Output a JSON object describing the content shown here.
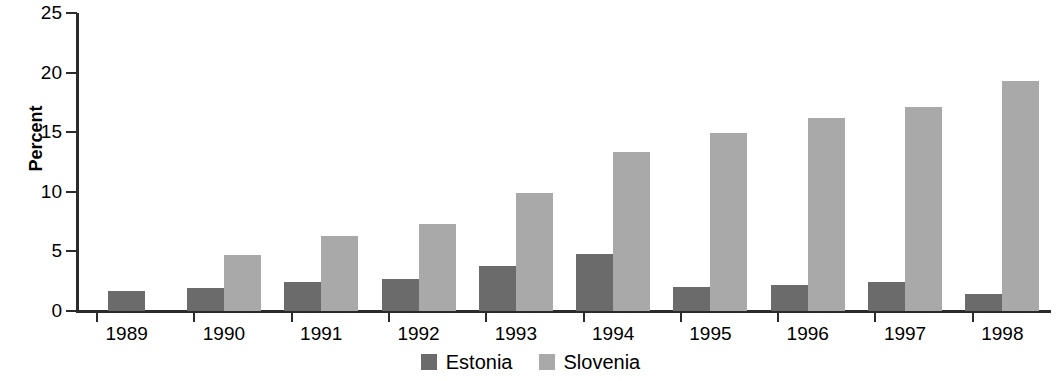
{
  "chart_data": {
    "type": "bar",
    "title": "",
    "xlabel": "",
    "ylabel": "Percent",
    "ylim": [
      0,
      25
    ],
    "yticks": [
      0,
      5,
      10,
      15,
      20,
      25
    ],
    "grid": false,
    "legend_position": "bottom-center",
    "categories": [
      "1989",
      "1990",
      "1991",
      "1992",
      "1993",
      "1994",
      "1995",
      "1996",
      "1997",
      "1998"
    ],
    "series": [
      {
        "name": "Estonia",
        "color": "#6b6b6b",
        "values": [
          1.7,
          1.9,
          2.4,
          2.7,
          3.8,
          4.8,
          2.0,
          2.2,
          2.4,
          1.4
        ]
      },
      {
        "name": "Slovenia",
        "color": "#a9a9a9",
        "values": [
          null,
          4.7,
          6.3,
          7.3,
          9.9,
          13.3,
          14.9,
          16.2,
          17.1,
          19.3
        ]
      }
    ]
  },
  "axis": {
    "y_label": "Percent",
    "y_ticks": [
      "0",
      "5",
      "10",
      "15",
      "20",
      "25"
    ],
    "x_ticks": [
      "1989",
      "1990",
      "1991",
      "1992",
      "1993",
      "1994",
      "1995",
      "1996",
      "1997",
      "1998"
    ]
  },
  "legend": {
    "items": [
      {
        "label": "Estonia",
        "color": "#6b6b6b"
      },
      {
        "label": "Slovenia",
        "color": "#a9a9a9"
      }
    ]
  }
}
